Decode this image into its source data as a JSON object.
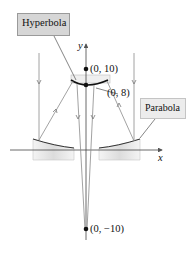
{
  "figure": {
    "callouts": {
      "hyperbola": "Hyperbola",
      "parabola": "Parabola"
    },
    "axes": {
      "x_label": "x",
      "y_label": "y"
    },
    "points": [
      {
        "label": "(0, 10)",
        "x": 0,
        "y": 10
      },
      {
        "label": "(0, 8)",
        "x": 0,
        "y": 8
      },
      {
        "label": "(0, −10)",
        "x": 0,
        "y": -10
      }
    ],
    "colors": {
      "ray": "#8a8a8a",
      "curve": "#222222",
      "mirror_fill": "#e6e6e6",
      "callout_fill": "#d6d6d6"
    }
  }
}
